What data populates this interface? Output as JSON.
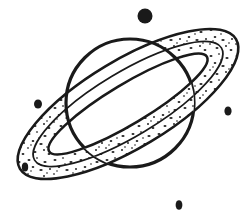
{
  "artwork": {
    "title": "Saturn with rings and stars",
    "subject": "saturn-planet-line-art",
    "style": "black-and-white stippled clip art",
    "background_color": "#ffffff",
    "ink_color": "#1a1a1a",
    "canvas": {
      "width": 252,
      "height": 221
    }
  },
  "planet": {
    "label": "Saturn",
    "fill_color": "#ffffff",
    "stroke_color": "#1a1a1a",
    "stroke_width": 3.2,
    "center_x": 130,
    "center_y": 103,
    "radius": 64
  },
  "ring": {
    "label": "Planetary ring system",
    "fill_color": "#ffffff",
    "stroke_color": "#1a1a1a",
    "stroke_width": 2.6,
    "stipple_color": "#262626",
    "center_x": 128,
    "center_y": 104,
    "outer_rx": 126,
    "outer_ry": 44,
    "inner_rx": 92,
    "inner_ry": 20,
    "rotation_deg": -31,
    "bands": 2
  },
  "stars": [
    {
      "name": "star-top",
      "x": 145,
      "y": 16,
      "rx": 7.5,
      "ry": 7.5,
      "color": "#1a1a1a"
    },
    {
      "name": "star-left",
      "x": 38,
      "y": 104,
      "rx": 4.0,
      "ry": 4.6,
      "color": "#1a1a1a"
    },
    {
      "name": "star-right",
      "x": 228,
      "y": 111,
      "rx": 3.6,
      "ry": 4.6,
      "color": "#1a1a1a"
    },
    {
      "name": "star-bottom-left",
      "x": 25,
      "y": 167,
      "rx": 3.2,
      "ry": 4.6,
      "color": "#1a1a1a"
    },
    {
      "name": "star-bottom",
      "x": 179,
      "y": 205,
      "rx": 3.4,
      "ry": 4.8,
      "color": "#1a1a1a"
    }
  ],
  "chart_data": {
    "type": "scatter",
    "title": "Saturn with rings and stars",
    "xlabel": "",
    "ylabel": "",
    "xlim": [
      0,
      252
    ],
    "ylim": [
      0,
      221
    ],
    "grid": false,
    "legend": "none",
    "series": [
      {
        "name": "stars",
        "marker": "filled-circle",
        "x": [
          145,
          38,
          228,
          25,
          179
        ],
        "y": [
          16,
          104,
          111,
          167,
          205
        ],
        "sizes": [
          7.5,
          4.0,
          3.6,
          3.2,
          3.4
        ]
      },
      {
        "name": "planet-body",
        "marker": "open-circle",
        "x": [
          130
        ],
        "y": [
          103
        ],
        "sizes": [
          64
        ]
      },
      {
        "name": "ring-annulus",
        "marker": "rotated-ellipse",
        "x": [
          128
        ],
        "y": [
          104
        ],
        "sizes": [
          126,
          44
        ],
        "rotation_deg": -31
      }
    ]
  }
}
